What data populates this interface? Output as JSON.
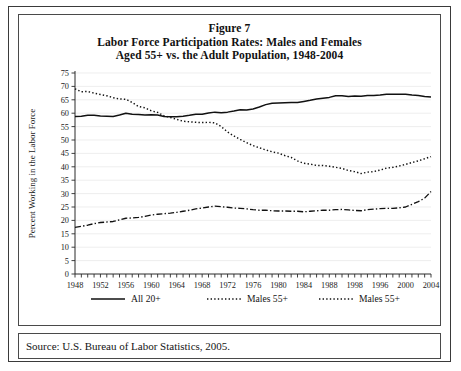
{
  "figure": {
    "label": "Figure 7",
    "title_line_1": "Labor Force Participation Rates: Males and Females",
    "title_line_2": "Aged 55+ vs. the Adult Population, 1948-2004",
    "source": "Source: U.S. Bureau of Labor Statistics, 2005."
  },
  "chart_data": {
    "type": "line",
    "title": "Labor Force Participation Rates: Males and Females Aged 55+ vs. the Adult Population, 1948-2004",
    "xlabel": "",
    "ylabel": "Percent Working in the Labor Force",
    "xlim": [
      1948,
      2004
    ],
    "ylim": [
      0,
      75
    ],
    "ytick_step": 5,
    "yticks": [
      0,
      5,
      10,
      15,
      20,
      25,
      30,
      35,
      40,
      45,
      50,
      55,
      60,
      65,
      70,
      75
    ],
    "xtick_step": 1,
    "xtick_label_step": 4,
    "xtick_labels": [
      "1948",
      "1952",
      "1956",
      "1960",
      "1964",
      "1968",
      "1972",
      "1976",
      "1980",
      "1984",
      "1988",
      "1998",
      "1996",
      "2000",
      "2004"
    ],
    "xtick_label_years": [
      1948,
      1952,
      1956,
      1960,
      1964,
      1968,
      1972,
      1976,
      1980,
      1984,
      1988,
      1992,
      1996,
      2000,
      2004
    ],
    "grid": "horizontal",
    "legend_position": "bottom",
    "x": [
      1948,
      1949,
      1950,
      1951,
      1952,
      1953,
      1954,
      1955,
      1956,
      1957,
      1958,
      1959,
      1960,
      1961,
      1962,
      1963,
      1964,
      1965,
      1966,
      1967,
      1968,
      1969,
      1970,
      1971,
      1972,
      1973,
      1974,
      1975,
      1976,
      1977,
      1978,
      1979,
      1980,
      1981,
      1982,
      1983,
      1984,
      1985,
      1986,
      1987,
      1988,
      1989,
      1990,
      1991,
      1992,
      1993,
      1994,
      1995,
      1996,
      1997,
      1998,
      1999,
      2000,
      2001,
      2002,
      2003,
      2004
    ],
    "series": [
      {
        "name": "All 20+",
        "style": "solid",
        "values": [
          58.8,
          58.9,
          59.2,
          59.2,
          59.0,
          58.9,
          58.8,
          59.3,
          60.0,
          59.6,
          59.5,
          59.3,
          59.4,
          59.3,
          58.8,
          58.7,
          58.7,
          58.9,
          59.2,
          59.6,
          59.6,
          60.1,
          60.4,
          60.2,
          60.4,
          60.8,
          61.3,
          61.2,
          61.6,
          62.3,
          63.2,
          63.7,
          63.8,
          63.9,
          64.0,
          64.0,
          64.4,
          64.8,
          65.3,
          65.6,
          65.9,
          66.5,
          66.5,
          66.2,
          66.4,
          66.3,
          66.6,
          66.6,
          66.8,
          67.1,
          67.1,
          67.1,
          67.1,
          66.8,
          66.6,
          66.2,
          66.0
        ]
      },
      {
        "name": "Males 55+",
        "style": "dotted",
        "values": [
          69.1,
          68.0,
          68.1,
          67.5,
          67.0,
          66.5,
          65.8,
          65.3,
          65.2,
          64.0,
          62.5,
          62.0,
          60.9,
          60.3,
          59.0,
          58.4,
          57.7,
          57.0,
          56.8,
          56.6,
          56.5,
          56.6,
          56.4,
          55.0,
          53.0,
          51.5,
          50.2,
          49.0,
          47.9,
          47.1,
          46.3,
          45.6,
          45.1,
          44.2,
          43.5,
          42.2,
          41.3,
          41.0,
          40.5,
          40.5,
          40.2,
          39.8,
          39.4,
          38.6,
          38.2,
          37.5,
          38.0,
          38.2,
          38.8,
          39.5,
          39.8,
          40.3,
          40.9,
          41.6,
          42.2,
          43.0,
          43.8
        ]
      },
      {
        "name": "Males 55+",
        "style": "dashdot",
        "values": [
          17.4,
          17.8,
          18.2,
          18.8,
          19.2,
          19.4,
          19.6,
          20.2,
          20.8,
          20.9,
          21.1,
          21.5,
          22.0,
          22.3,
          22.5,
          22.7,
          23.0,
          23.4,
          23.8,
          24.3,
          24.6,
          25.0,
          25.3,
          25.1,
          24.9,
          24.6,
          24.5,
          24.3,
          24.0,
          23.8,
          23.8,
          23.6,
          23.5,
          23.5,
          23.4,
          23.4,
          23.2,
          23.4,
          23.6,
          23.8,
          23.8,
          24.0,
          24.1,
          23.9,
          23.7,
          23.6,
          24.0,
          24.2,
          24.4,
          24.5,
          24.5,
          24.7,
          25.0,
          26.0,
          27.0,
          28.3,
          30.8
        ]
      }
    ],
    "legend": [
      {
        "label": "All 20+",
        "style": "solid"
      },
      {
        "label": "Males 55+",
        "style": "dotted"
      },
      {
        "label": "Males 55+",
        "style": "dotted"
      }
    ]
  }
}
